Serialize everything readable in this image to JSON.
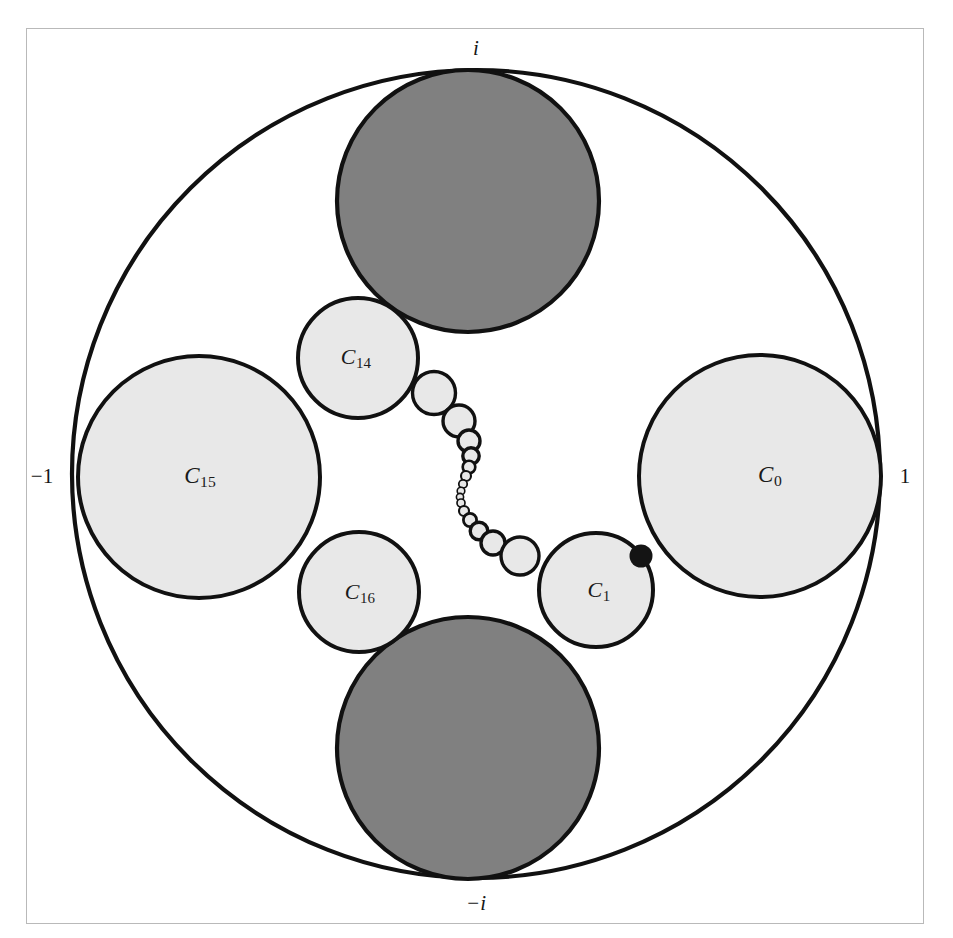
{
  "figure": {
    "kind": "circle-packing-in-unit-disk",
    "background_color": "#ffffff",
    "frame_border_color": "#b9b9b9",
    "outline_color": "#111111",
    "light_fill": "#e8e8e8",
    "dark_fill": "#808080",
    "dot_fill": "#141414"
  },
  "axis_labels": [
    {
      "id": "top",
      "text": "i",
      "x": 476,
      "y": 48,
      "italic": true
    },
    {
      "id": "bottom",
      "text": "−i",
      "x": 476,
      "y": 903,
      "italic": true
    },
    {
      "id": "left",
      "text": "−1",
      "x": 42,
      "y": 476,
      "italic": false
    },
    {
      "id": "right",
      "text": "1",
      "x": 905,
      "y": 476,
      "italic": false
    }
  ],
  "circle_labels": [
    {
      "id": "C0",
      "base": "C",
      "sub": "0",
      "x": 770,
      "y": 476,
      "size": 23
    },
    {
      "id": "C1",
      "base": "C",
      "sub": "1",
      "x": 599,
      "y": 592,
      "size": 22
    },
    {
      "id": "C14",
      "base": "C",
      "sub": "14",
      "x": 356,
      "y": 359,
      "size": 22
    },
    {
      "id": "C15",
      "base": "C",
      "sub": "15",
      "x": 200,
      "y": 477,
      "size": 23
    },
    {
      "id": "C16",
      "base": "C",
      "sub": "16",
      "x": 360,
      "y": 594,
      "size": 22
    }
  ],
  "unit_circle": {
    "cx": 476,
    "cy": 474,
    "r": 404,
    "stroke_width": 4.2
  },
  "dark_circles": [
    {
      "id": "dark-top",
      "cx": 468,
      "cy": 201,
      "r": 131
    },
    {
      "id": "dark-bottom",
      "cx": 468,
      "cy": 748,
      "r": 131
    }
  ],
  "light_circles": [
    {
      "id": "C0",
      "cx": 760,
      "cy": 476,
      "r": 121
    },
    {
      "id": "C15",
      "cx": 199,
      "cy": 477,
      "r": 121
    },
    {
      "id": "C14",
      "cx": 358,
      "cy": 358,
      "r": 60
    },
    {
      "id": "C16",
      "cx": 359,
      "cy": 592,
      "r": 60
    },
    {
      "id": "C1",
      "cx": 596,
      "cy": 590,
      "r": 57
    }
  ],
  "chain_circles": [
    {
      "cx": 434,
      "cy": 393,
      "r": 21.5
    },
    {
      "cx": 459,
      "cy": 421,
      "r": 16.0
    },
    {
      "cx": 469,
      "cy": 441,
      "r": 11.0
    },
    {
      "cx": 471,
      "cy": 456,
      "r": 8.2
    },
    {
      "cx": 469,
      "cy": 467,
      "r": 6.3
    },
    {
      "cx": 466,
      "cy": 476,
      "r": 5.0
    },
    {
      "cx": 463,
      "cy": 484,
      "r": 4.2
    },
    {
      "cx": 461,
      "cy": 491,
      "r": 3.8
    },
    {
      "cx": 460,
      "cy": 497,
      "r": 3.6
    },
    {
      "cx": 461,
      "cy": 503,
      "r": 4.0
    },
    {
      "cx": 464,
      "cy": 511,
      "r": 5.0
    },
    {
      "cx": 470,
      "cy": 520,
      "r": 6.6
    },
    {
      "cx": 479,
      "cy": 531,
      "r": 8.8
    },
    {
      "cx": 493,
      "cy": 543,
      "r": 12.0
    },
    {
      "cx": 520,
      "cy": 556,
      "r": 19.0
    }
  ],
  "tangency_dots": [
    {
      "id": "C0-C1-tangency",
      "cx": 641,
      "cy": 556,
      "r": 11.5
    }
  ]
}
